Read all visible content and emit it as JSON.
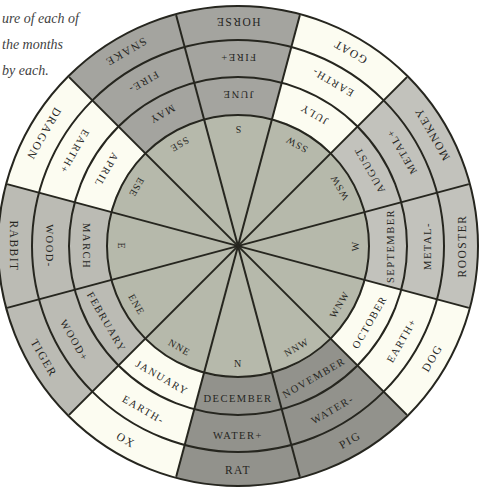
{
  "caption": {
    "lines": [
      "ure of each of",
      "the months",
      "by each."
    ]
  },
  "wheel": {
    "orientation_note": "S at top, N at bottom",
    "colors": {
      "fire": "#a4a49f",
      "water": "#92928c",
      "metal": "#c2c2bc",
      "wood": "#bbbbb4",
      "earth": "#fcfcf1",
      "center": "#b6b9ab",
      "stroke": "#26261f"
    },
    "sectors": [
      {
        "animal": "HORSE",
        "element": "FIRE+",
        "month": "JUNE",
        "direction": "S",
        "element_group": "fire"
      },
      {
        "animal": "GOAT",
        "element": "EARTH-",
        "month": "JULY",
        "direction": "SSW",
        "element_group": "earth"
      },
      {
        "animal": "MONKEY",
        "element": "METAL+",
        "month": "AUGUST",
        "direction": "WSW",
        "element_group": "metal"
      },
      {
        "animal": "ROOSTER",
        "element": "METAL-",
        "month": "SEPTEMBER",
        "direction": "W",
        "element_group": "metal"
      },
      {
        "animal": "DOG",
        "element": "EARTH+",
        "month": "OCTOBER",
        "direction": "WNW",
        "element_group": "earth"
      },
      {
        "animal": "PIG",
        "element": "WATER-",
        "month": "NOVEMBER",
        "direction": "NNW",
        "element_group": "water"
      },
      {
        "animal": "RAT",
        "element": "WATER+",
        "month": "DECEMBER",
        "direction": "N",
        "element_group": "water"
      },
      {
        "animal": "OX",
        "element": "EARTH-",
        "month": "JANUARY",
        "direction": "NNE",
        "element_group": "earth"
      },
      {
        "animal": "TIGER",
        "element": "WOOD+",
        "month": "FEBRUARY",
        "direction": "ENE",
        "element_group": "wood"
      },
      {
        "animal": "RABBIT",
        "element": "WOOD-",
        "month": "MARCH",
        "direction": "E",
        "element_group": "wood"
      },
      {
        "animal": "DRAGON",
        "element": "EARTH+",
        "month": "APRIL",
        "direction": "ESE",
        "element_group": "earth"
      },
      {
        "animal": "SNAKE",
        "element": "FIRE-",
        "month": "MAY",
        "direction": "SSE",
        "element_group": "fire"
      }
    ]
  }
}
